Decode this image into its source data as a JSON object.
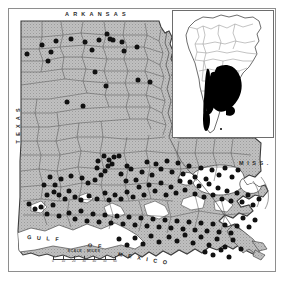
{
  "figure": {
    "kind": "distribution-map",
    "width": 286,
    "height": 282,
    "background_color": "#ffffff",
    "frame_color": "#8e8e8e"
  },
  "main_map": {
    "name": "Louisiana parish distribution map",
    "land_fill_color": "#b8b8b8",
    "water_fill_color": "#ffffff",
    "boundary_color": "#4a4a4a",
    "dot_color": "#111111",
    "labels": {
      "north": "ARKANSAS",
      "west": "TEXAS",
      "east": "MISS.",
      "sea_line1": "GULF",
      "sea_line2": "OF",
      "sea_line3": "MEXICO"
    },
    "scale": {
      "title": "SCALE - MILES",
      "ticks": [
        "0",
        "10",
        "20",
        "30",
        "40",
        "50",
        "60"
      ]
    },
    "record_dot_count": 186
  },
  "inset_map": {
    "name": "South America range inset",
    "outline_color": "#555555",
    "range_fill_color": "#000000",
    "background_color": "#ffffff"
  },
  "chart_data": {
    "type": "scatter",
    "title": "",
    "xlabel": "",
    "ylabel": "",
    "legend": [],
    "series": [
      {
        "name": "collection localities",
        "marker": "filled-circle",
        "color": "#111111",
        "points": [
          [
            18,
            45
          ],
          [
            33,
            36
          ],
          [
            39,
            52
          ],
          [
            42,
            43
          ],
          [
            47,
            32
          ],
          [
            62,
            30
          ],
          [
            76,
            33
          ],
          [
            83,
            41
          ],
          [
            90,
            31
          ],
          [
            98,
            25
          ],
          [
            101,
            30
          ],
          [
            104,
            31
          ],
          [
            113,
            33
          ],
          [
            115,
            42
          ],
          [
            128,
            38
          ],
          [
            129,
            71
          ],
          [
            141,
            73
          ],
          [
            86,
            63
          ],
          [
            97,
            77
          ],
          [
            58,
            93
          ],
          [
            74,
            97
          ],
          [
            96,
            162
          ],
          [
            99,
            157
          ],
          [
            100,
            151
          ],
          [
            103,
            155
          ],
          [
            105,
            148
          ],
          [
            92,
            166
          ],
          [
            88,
            159
          ],
          [
            110,
            147
          ],
          [
            118,
            157
          ],
          [
            95,
            147
          ],
          [
            89,
            152
          ],
          [
            86,
            171
          ],
          [
            79,
            174
          ],
          [
            73,
            169
          ],
          [
            62,
            167
          ],
          [
            52,
            170
          ],
          [
            46,
            176
          ],
          [
            41,
            168
          ],
          [
            35,
            176
          ],
          [
            38,
            186
          ],
          [
            45,
            183
          ],
          [
            50,
            186
          ],
          [
            56,
            190
          ],
          [
            60,
            182
          ],
          [
            66,
            188
          ],
          [
            72,
            191
          ],
          [
            80,
            187
          ],
          [
            88,
            190
          ],
          [
            96,
            184
          ],
          [
            100,
            191
          ],
          [
            106,
            186
          ],
          [
            112,
            190
          ],
          [
            118,
            183
          ],
          [
            124,
            188
          ],
          [
            130,
            178
          ],
          [
            135,
            186
          ],
          [
            140,
            176
          ],
          [
            146,
            182
          ],
          [
            152,
            174
          ],
          [
            157,
            186
          ],
          [
            162,
            178
          ],
          [
            167,
            184
          ],
          [
            171,
            172
          ],
          [
            176,
            181
          ],
          [
            181,
            173
          ],
          [
            186,
            185
          ],
          [
            190,
            177
          ],
          [
            195,
            188
          ],
          [
            200,
            175
          ],
          [
            204,
            186
          ],
          [
            209,
            179
          ],
          [
            213,
            190
          ],
          [
            218,
            182
          ],
          [
            222,
            192
          ],
          [
            228,
            184
          ],
          [
            233,
            193
          ],
          [
            239,
            186
          ],
          [
            244,
            196
          ],
          [
            250,
            190
          ],
          [
            152,
            160
          ],
          [
            158,
            152
          ],
          [
            163,
            163
          ],
          [
            169,
            154
          ],
          [
            174,
            165
          ],
          [
            180,
            157
          ],
          [
            186,
            168
          ],
          [
            192,
            159
          ],
          [
            197,
            170
          ],
          [
            203,
            161
          ],
          [
            133,
            163
          ],
          [
            138,
            153
          ],
          [
            143,
            166
          ],
          [
            147,
            155
          ],
          [
            210,
            166
          ],
          [
            216,
            159
          ],
          [
            223,
            168
          ],
          [
            229,
            161
          ],
          [
            112,
            165
          ],
          [
            117,
            172
          ],
          [
            122,
            160
          ],
          [
            127,
            171
          ],
          [
            60,
            204
          ],
          [
            66,
            210
          ],
          [
            72,
            202
          ],
          [
            78,
            212
          ],
          [
            84,
            205
          ],
          [
            90,
            213
          ],
          [
            96,
            206
          ],
          [
            102,
            214
          ],
          [
            108,
            207
          ],
          [
            114,
            215
          ],
          [
            120,
            208
          ],
          [
            126,
            216
          ],
          [
            132,
            209
          ],
          [
            138,
            217
          ],
          [
            144,
            210
          ],
          [
            150,
            218
          ],
          [
            156,
            211
          ],
          [
            162,
            219
          ],
          [
            168,
            212
          ],
          [
            174,
            220
          ],
          [
            180,
            213
          ],
          [
            186,
            221
          ],
          [
            192,
            214
          ],
          [
            198,
            222
          ],
          [
            204,
            215
          ],
          [
            210,
            223
          ],
          [
            216,
            216
          ],
          [
            222,
            224
          ],
          [
            228,
            217
          ],
          [
            234,
            209
          ],
          [
            240,
            218
          ],
          [
            246,
            211
          ],
          [
            32,
            198
          ],
          [
            38,
            205
          ],
          [
            44,
            196
          ],
          [
            50,
            207
          ],
          [
            26,
            200
          ],
          [
            20,
            195
          ],
          [
            160,
            228
          ],
          [
            168,
            232
          ],
          [
            176,
            226
          ],
          [
            184,
            234
          ],
          [
            192,
            228
          ],
          [
            200,
            236
          ],
          [
            208,
            230
          ],
          [
            216,
            238
          ],
          [
            224,
            231
          ],
          [
            232,
            240
          ],
          [
            196,
            243
          ],
          [
            204,
            246
          ],
          [
            212,
            241
          ],
          [
            220,
            248
          ],
          [
            150,
            233
          ],
          [
            142,
            227
          ],
          [
            134,
            235
          ],
          [
            126,
            229
          ],
          [
            118,
            236
          ],
          [
            110,
            230
          ]
        ]
      }
    ]
  }
}
